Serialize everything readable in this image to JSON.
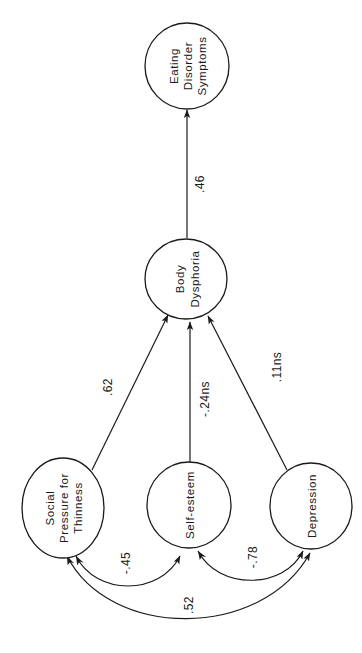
{
  "diagram": {
    "orientation": "rotated 90 degrees counter-clockwise (text reads bottom-to-top)",
    "colors": {
      "ink": "#1a1a1a",
      "background": "#ffffff"
    },
    "nodes": {
      "eating_disorder": {
        "lines": [
          "Eating",
          "Disorder",
          "Symptoms"
        ]
      },
      "body_dysphoria": {
        "lines": [
          "Body",
          "Dysphoria"
        ]
      },
      "social_pressure": {
        "lines": [
          "Social",
          "Pressure for",
          "Thinness"
        ]
      },
      "self_esteem": {
        "lines": [
          "Self-esteem"
        ]
      },
      "depression": {
        "lines": [
          "Depression"
        ]
      }
    },
    "paths": {
      "body_to_eating": {
        "from": "Body Dysphoria",
        "to": "Eating Disorder Symptoms",
        "label": ".46"
      },
      "social_to_body": {
        "from": "Social Pressure for Thinness",
        "to": "Body Dysphoria",
        "label": ".62"
      },
      "selfesteem_to_body": {
        "from": "Self-esteem",
        "to": "Body Dysphoria",
        "label": "-.24ns"
      },
      "depression_to_body": {
        "from": "Depression",
        "to": "Body Dysphoria",
        "label": ".11ns"
      }
    },
    "correlations": {
      "social_selfesteem": {
        "between": [
          "Social Pressure for Thinness",
          "Self-esteem"
        ],
        "label": "-.45"
      },
      "selfesteem_depression": {
        "between": [
          "Self-esteem",
          "Depression"
        ],
        "label": "-.78"
      },
      "social_depression": {
        "between": [
          "Social Pressure for Thinness",
          "Depression"
        ],
        "label": ".52"
      }
    }
  }
}
